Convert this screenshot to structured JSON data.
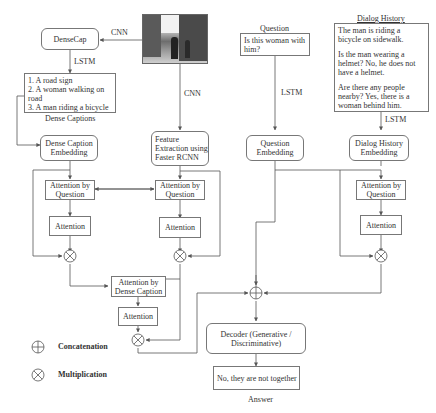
{
  "diagram": {
    "image_input": {
      "icon": "street-photo"
    },
    "edge_labels": {
      "cnn_top": "CNN",
      "cnn_side": "CNN",
      "lstm_densecap": "LSTM",
      "lstm_question": "LSTM",
      "lstm_history": "LSTM"
    },
    "densecap": {
      "label": "DenseCap"
    },
    "dense_captions": {
      "title": "Dense Captions",
      "items": [
        "1. A road sign",
        "2. A woman walking on road",
        "3. A man riding a bicycle"
      ]
    },
    "question": {
      "title": "Question",
      "text": "Is this woman with him?"
    },
    "dialog_history": {
      "title": "Dialog History",
      "paragraphs": [
        "The man is riding a bicycle on sidewalk.",
        "Is the man wearing a helmet? No, he does not have a helmet.",
        "Are there any people nearby? Yes, there is a woman behind him."
      ]
    },
    "embeddings": {
      "dense_caption": "Dense Caption Embedding",
      "feature_extraction": "Feature Extraction using Faster RCNN",
      "question": "Question Embedding",
      "dialog_history": "Dialog History Embedding"
    },
    "attention_blocks": {
      "caption_attn_by_question": "Attention by Question",
      "caption_attention": "Attention",
      "image_attn_by_question": "Attention by Question",
      "image_attention": "Attention",
      "history_attn_by_question": "Attention by Question",
      "history_attention": "Attention",
      "attn_by_dense_caption": "Attention by Dense Caption",
      "dense_caption_attention": "Attention"
    },
    "decoder": {
      "label": "Decoder (Generative / Discriminative)"
    },
    "answer": {
      "title": "Answer",
      "text": "No, they are not together"
    },
    "legend": {
      "items": [
        {
          "symbol": "circle-plus",
          "label": "Concatenation"
        },
        {
          "symbol": "circle-times",
          "label": "Multiplication"
        }
      ]
    },
    "colors": {
      "line": "#555555",
      "box_border": "#777777",
      "text": "#333333"
    }
  }
}
